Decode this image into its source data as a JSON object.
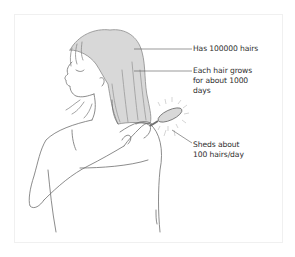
{
  "figure": {
    "colors": {
      "hair_fill": "#d8d8d8",
      "line": "#6e6e6e",
      "text": "#2e2e2e",
      "frame": "#f0f0f0"
    }
  },
  "annotations": [
    {
      "id": "count",
      "text": "Has 100000 hairs"
    },
    {
      "id": "growth",
      "text": "Each hair grows\nfor about 1000\ndays"
    },
    {
      "id": "shedding",
      "text": "Sheds about\n100 hairs/day"
    }
  ]
}
